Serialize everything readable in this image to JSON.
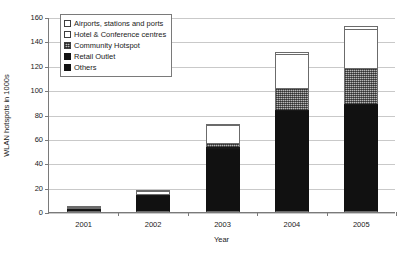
{
  "chart_data": {
    "type": "bar",
    "stacked": true,
    "title": "",
    "xlabel": "Year",
    "ylabel": "WLAN hotspots in 1000s",
    "categories": [
      "2001",
      "2002",
      "2003",
      "2004",
      "2005"
    ],
    "ylim": [
      0,
      160
    ],
    "ytick_values": [
      0,
      20,
      40,
      60,
      80,
      100,
      120,
      140,
      160
    ],
    "ytick_labels": [
      "0",
      "20",
      "40",
      "60",
      "80",
      "100",
      "120",
      "140",
      "160"
    ],
    "grid": true,
    "legend_position": "upper-left-inside",
    "series": [
      {
        "name": "Others",
        "values": [
          0.4,
          13,
          52,
          83,
          88
        ]
      },
      {
        "name": "Retail Outlet",
        "values": [
          0.1,
          0.5,
          1,
          1,
          1
        ]
      },
      {
        "name": "Community Hotspot",
        "values": [
          0.1,
          0.5,
          4,
          18,
          29
        ]
      },
      {
        "name": "Hotel & Conference centres",
        "values": [
          0.1,
          3,
          14,
          28,
          32
        ]
      },
      {
        "name": "Airports, stations and ports",
        "values": [
          0.1,
          0.5,
          1,
          1,
          3
        ]
      }
    ],
    "totals": [
      0.8,
      17,
      72,
      131,
      153
    ]
  },
  "legend": {
    "items": [
      {
        "label": "Airports, stations and ports",
        "swatch": "white-outline"
      },
      {
        "label": "Hotel & Conference centres",
        "swatch": "white-outline"
      },
      {
        "label": "Community Hotspot",
        "swatch": "grey-hatched"
      },
      {
        "label": "Retail Outlet",
        "swatch": "black"
      },
      {
        "label": "Others",
        "swatch": "black"
      }
    ]
  }
}
